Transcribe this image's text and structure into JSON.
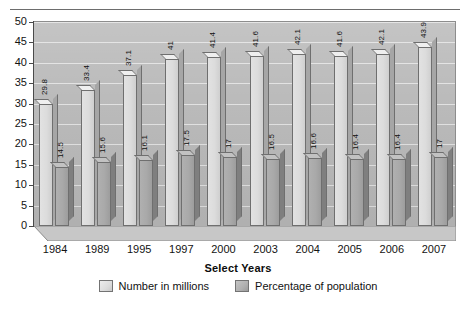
{
  "chart_data": {
    "type": "bar",
    "title": "",
    "xlabel": "Select Years",
    "ylabel": "",
    "ylim": [
      0,
      50
    ],
    "yticks": [
      0,
      5,
      10,
      15,
      20,
      25,
      30,
      35,
      40,
      45,
      50
    ],
    "grid": true,
    "legend_position": "bottom",
    "categories": [
      "1984",
      "1989",
      "1995",
      "1997",
      "2000",
      "2003",
      "2004",
      "2005",
      "2006",
      "2007"
    ],
    "series": [
      {
        "name": "Number in millions",
        "color": "#dcdcdc",
        "values": [
          29.8,
          33.4,
          37.1,
          41,
          41.4,
          41.6,
          42.1,
          41.6,
          42.1,
          43.9
        ],
        "labels": [
          "29.8",
          "33.4",
          "37.1",
          "41",
          "41.4",
          "41.6",
          "42.1",
          "41.6",
          "42.1",
          "43.9"
        ]
      },
      {
        "name": "Percentage of population",
        "color": "#a9a9a9",
        "values": [
          14.5,
          15.6,
          16.1,
          17.5,
          17,
          16.5,
          16.6,
          16.4,
          16.4,
          17
        ],
        "labels": [
          "14.5",
          "15.6",
          "16.1",
          "17.5",
          "17",
          "16.5",
          "16.6",
          "16.4",
          "16.4",
          "17"
        ]
      }
    ]
  },
  "legend": {
    "items": [
      {
        "label": "Number in millions"
      },
      {
        "label": "Percentage of population"
      }
    ]
  },
  "colors": {
    "plot_background": "#b9b9b9",
    "gridline": "#e8e8e8",
    "axis": "#4a4a4a",
    "series_a": "#dcdcdc",
    "series_b": "#a9a9a9"
  }
}
